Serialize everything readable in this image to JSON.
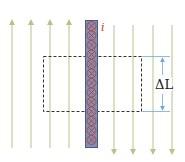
{
  "diagram": {
    "type": "magnetic-field-current-conductor",
    "labels": {
      "current": "i",
      "length": "ΔL"
    },
    "colors": {
      "field_lines": "#b5c48a",
      "conductor_fill": "#7f8fb5",
      "conductor_border": "#4a5a8a",
      "current_symbols": "#c0392b",
      "dashed_box": "#333333",
      "dimension": "#6fa8dc",
      "background": "#ffffff"
    },
    "field_lines_up_x": [
      12,
      31,
      50,
      69
    ],
    "field_lines_down_x": [
      114,
      133,
      153,
      172
    ],
    "current_direction": "into-page",
    "current_symbol_count": 13
  }
}
